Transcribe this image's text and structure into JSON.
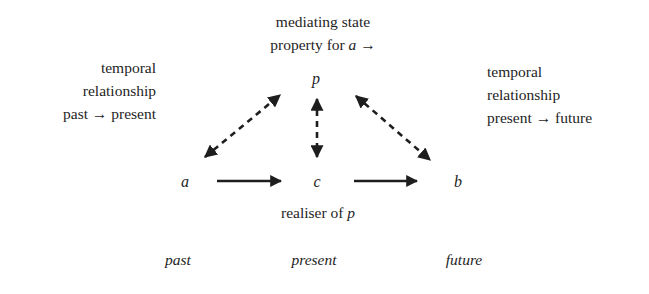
{
  "top_label": {
    "line1": "mediating state",
    "line2_prefix": "property for ",
    "line2_var": "a",
    "line2_suffix": " →"
  },
  "left_label": {
    "line1": "temporal",
    "line2": "relationship",
    "line3": "past → present"
  },
  "right_label": {
    "line1": "temporal",
    "line2": "relationship",
    "line3": "present → future"
  },
  "nodes": {
    "p": "p",
    "a": "a",
    "c": "c",
    "b": "b"
  },
  "bottom_label": {
    "prefix": "realiser of ",
    "var": "p"
  },
  "timeline": {
    "past": "past",
    "present": "present",
    "future": "future"
  },
  "edges": [
    {
      "from": "a",
      "to": "p",
      "style": "dashed",
      "direction": "bidirectional"
    },
    {
      "from": "c",
      "to": "p",
      "style": "dashed",
      "direction": "bidirectional"
    },
    {
      "from": "b",
      "to": "p",
      "style": "dashed",
      "direction": "bidirectional"
    },
    {
      "from": "a",
      "to": "c",
      "style": "solid",
      "direction": "forward"
    },
    {
      "from": "c",
      "to": "b",
      "style": "solid",
      "direction": "forward"
    }
  ],
  "colors": {
    "ink": "#1e1e1e",
    "background": "#ffffff"
  }
}
